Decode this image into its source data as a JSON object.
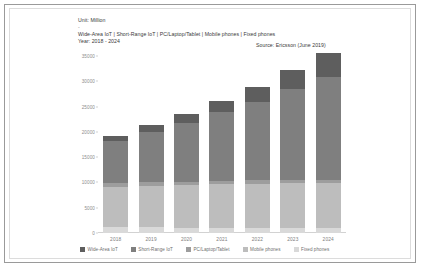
{
  "header": {
    "unit": "Unit: Million",
    "dash": "-",
    "series_line": "Wide-Area IoT | Short-Range IoT | PC/Laptop/Tablet | Mobile phones | Fixed phones",
    "year_line": "Year: 2018 - 2024",
    "source": "Source: Ericsson (June 2019)"
  },
  "colors": {
    "wide_area_iot": "#5e5e5e",
    "short_range_iot": "#7f7f7f",
    "pc_laptop_tablet": "#9d9d9d",
    "mobile_phones": "#bdbdbd",
    "fixed_phones": "#d9d9d9",
    "axis": "#d2d2d2",
    "tick_text": "#8d8d8d",
    "card_border": "#9a9a9a"
  },
  "chart_data": {
    "type": "bar",
    "title": "",
    "subtitle": "",
    "xlabel": "",
    "ylabel": "Unit: Million",
    "ylim": [
      0,
      35000
    ],
    "yticks": [
      0,
      5000,
      10000,
      15000,
      20000,
      25000,
      30000,
      35000
    ],
    "ytick_labels": [
      "0",
      "5000",
      "10000",
      "15000",
      "20000",
      "25000",
      "30000",
      "35000"
    ],
    "grid": false,
    "stacked": true,
    "legend_position": "bottom",
    "categories": [
      "2018",
      "2019",
      "2020",
      "2021",
      "2022",
      "2023",
      "2024"
    ],
    "series": [
      {
        "name": "Fixed phones",
        "values": [
          1100,
          1100,
          1050,
          1050,
          1000,
          1000,
          950
        ]
      },
      {
        "name": "Mobile phones",
        "values": [
          8000,
          8200,
          8400,
          8550,
          8700,
          8800,
          8850
        ]
      },
      {
        "name": "PC/Laptop/Tablet",
        "values": [
          700,
          700,
          700,
          700,
          700,
          700,
          700
        ]
      },
      {
        "name": "Short-Range IoT",
        "values": [
          8300,
          10000,
          11700,
          13700,
          15600,
          18000,
          20300
        ]
      },
      {
        "name": "Wide-Area IoT",
        "values": [
          1000,
          1300,
          1700,
          2200,
          2900,
          3800,
          4800
        ]
      }
    ],
    "totals": [
      19100,
      21300,
      23550,
      26200,
      28900,
      32300,
      35600
    ],
    "annotations": [
      "Unit: Million",
      "Wide-Area IoT | Short-Range IoT | PC/Laptop/Tablet | Mobile phones | Fixed phones",
      "Year: 2018 - 2024",
      "Source: Ericsson (June 2019)"
    ]
  }
}
